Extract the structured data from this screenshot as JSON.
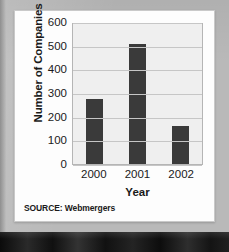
{
  "figure": {
    "source_note": "SOURCE: Webmergers"
  },
  "colors": {
    "bar": "#3a3a3a",
    "plot_background": "#efefef",
    "gridline": "#c6c6c6",
    "card": "#fdfdfd",
    "page_background": "#b9b9b9"
  },
  "chart_data": {
    "type": "bar",
    "title": "",
    "xlabel": "Year",
    "ylabel": "Number of Companies",
    "categories": [
      "2000",
      "2001",
      "2002"
    ],
    "values": [
      275,
      505,
      160
    ],
    "series": [
      {
        "name": "Number of Companies",
        "values": [
          275,
          505,
          160
        ]
      }
    ],
    "ylim": [
      0,
      600
    ],
    "ytick_labels": [
      "600",
      "500",
      "400",
      "300",
      "200",
      "100",
      "0"
    ],
    "ytick_values": [
      600,
      500,
      400,
      300,
      200,
      100,
      0
    ],
    "grid": true,
    "legend": "none"
  }
}
